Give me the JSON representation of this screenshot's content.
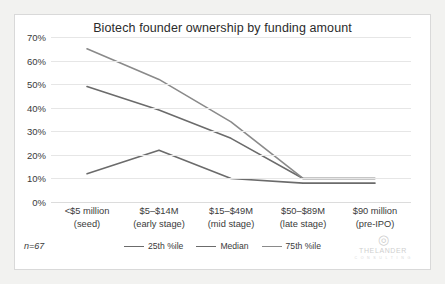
{
  "chart_data": {
    "type": "line",
    "title": "Biotech founder ownership by funding amount",
    "xlabel": "",
    "ylabel": "",
    "ylim": [
      0,
      70
    ],
    "ytick_step": 10,
    "ytick_labels": [
      "70%",
      "60%",
      "50%",
      "40%",
      "30%",
      "20%",
      "10%",
      "0%"
    ],
    "ytick_values": [
      70,
      60,
      50,
      40,
      30,
      20,
      10,
      0
    ],
    "grid": true,
    "legend_position": "bottom",
    "categories": [
      "<$5 million\n(seed)",
      "$5–$14M\n(early stage)",
      "$15–$49M\n(mid stage)",
      "$50–$89M\n(late stage)",
      "$90 million\n(pre-IPO)"
    ],
    "category_lines": [
      [
        "<$5 million",
        "(seed)"
      ],
      [
        "$5–$14M",
        "(early stage)"
      ],
      [
        "$15–$49M",
        "(mid stage)"
      ],
      [
        "$50–$89M",
        "(late stage)"
      ],
      [
        "$90 million",
        "(pre-IPO)"
      ]
    ],
    "series": [
      {
        "name": "25th %ile",
        "color": "#6b6b6b",
        "values": [
          12,
          22,
          10,
          8,
          8
        ]
      },
      {
        "name": "Median",
        "color": "#6b6b6b",
        "values": [
          49,
          39,
          27,
          10,
          10
        ]
      },
      {
        "name": "75th %ile",
        "color": "#8a8a8a",
        "values": [
          65,
          52,
          34,
          10,
          10
        ]
      }
    ],
    "annotation": "n=67"
  },
  "logo": {
    "mark": "$",
    "word": "THELANDER",
    "sub": "C O N S U L T I N G"
  }
}
